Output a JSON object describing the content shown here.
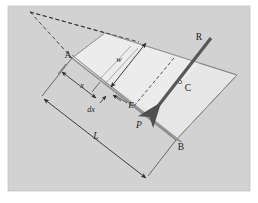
{
  "figure": {
    "kind": "engineering-diagram",
    "panel": {
      "background_color": "#d2d2d2",
      "page_color": "#ffffff",
      "border_color": "#b4b4b4",
      "x": 8,
      "y": 6,
      "width": 242,
      "height": 185
    },
    "colors": {
      "plate_top_face": "#e9e9e9",
      "plate_right_face": "#e3e3e3",
      "plate_edge_band": "#9a9a9a",
      "outline": "#6e6e6e",
      "arrow_resultant": "#5a5a5a",
      "dimension_line": "#3a3a3a",
      "dashed_line": "#2b2b2b",
      "label_text": "#1b1b1b"
    },
    "labels": [
      {
        "id": "A",
        "text": "A",
        "x": 68,
        "y": 58,
        "style": "upright",
        "size": 9
      },
      {
        "id": "B",
        "text": "B",
        "x": 180,
        "y": 148,
        "style": "upright",
        "size": 9
      },
      {
        "id": "C",
        "text": "C",
        "x": 185,
        "y": 88,
        "style": "upright",
        "size": 9
      },
      {
        "id": "R",
        "text": "R",
        "x": 198,
        "y": 38,
        "style": "upright",
        "size": 9
      },
      {
        "id": "E",
        "text": "E",
        "x": 118,
        "y": 105,
        "style": "italic",
        "size": 9
      },
      {
        "id": "P",
        "text": "P",
        "x": 138,
        "y": 125,
        "style": "italic",
        "size": 9
      },
      {
        "id": "w",
        "text": "w",
        "x": 119,
        "y": 60,
        "style": "italic",
        "size": 8
      },
      {
        "id": "x",
        "text": "x",
        "x": 83,
        "y": 86,
        "style": "italic",
        "size": 8
      },
      {
        "id": "dx",
        "text": "dx",
        "x": 89,
        "y": 108,
        "style": "italic",
        "size": 8
      },
      {
        "id": "L",
        "text": "L",
        "x": 96,
        "y": 135,
        "style": "italic",
        "size": 9
      }
    ],
    "geometry": {
      "plate_top_corners": "A(72,58) top-left(105,33) right(237,75) B(176,140)",
      "band_from": [
        72,
        58
      ],
      "band_to": [
        176,
        140
      ],
      "apex": [
        30,
        12
      ],
      "resultant_tip": [
        152,
        113
      ],
      "resultant_tail": [
        211,
        38
      ],
      "centroid_point": [
        180,
        84
      ]
    }
  }
}
